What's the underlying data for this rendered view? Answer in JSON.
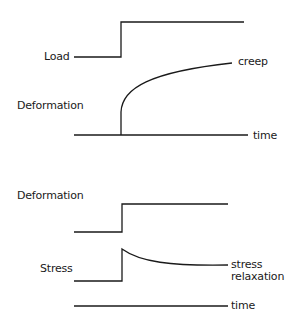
{
  "diagram": {
    "panels": [
      {
        "id": "creep",
        "labels": {
          "load": "Load",
          "deformation": "Deformation",
          "curve": "creep",
          "axis": "time"
        }
      },
      {
        "id": "stress_relaxation",
        "labels": {
          "deformation": "Deformation",
          "stress": "Stress",
          "curve_line1": "stress",
          "curve_line2": "relaxation",
          "axis": "time"
        }
      }
    ],
    "colors": {
      "line": "#1a1a1a",
      "background": "#ffffff"
    }
  }
}
